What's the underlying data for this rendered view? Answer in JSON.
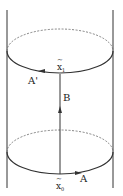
{
  "diagram": {
    "type": "cylinder-loop-diagram",
    "colors": {
      "line": "#333333",
      "dashed": "#666666",
      "background": "#ffffff"
    },
    "labels": {
      "x1": "x",
      "x1_sub": "1",
      "x1_accent": "~",
      "x0": "x",
      "x0_sub": "0",
      "x0_accent": "~",
      "A_prime": "A'",
      "A": "A",
      "B": "B"
    },
    "elements": {
      "cylinder_walls": 2,
      "circles": [
        {
          "name": "top",
          "front": "solid",
          "back": "dashed"
        },
        {
          "name": "bottom",
          "front": "solid",
          "back": "dashed"
        }
      ],
      "arrows": [
        {
          "name": "A",
          "path": "bottom-circle-front",
          "direction": "right"
        },
        {
          "name": "A'",
          "path": "top-circle-front",
          "direction": "left"
        },
        {
          "name": "B",
          "path": "vertical x0 to x1",
          "direction": "up"
        }
      ]
    }
  }
}
